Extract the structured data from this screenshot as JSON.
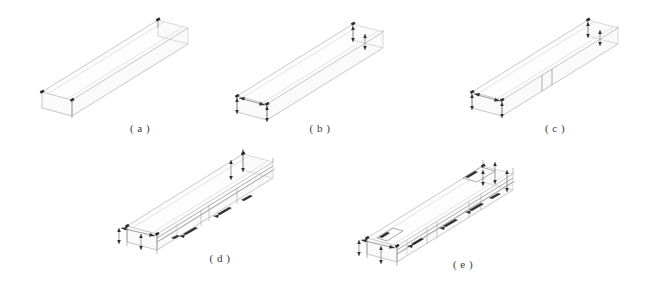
{
  "figure": {
    "background_color": "#ffffff",
    "line_color_light": "#d0d0d0",
    "line_color_dark": "#8a8a8a",
    "annotation_color": "#2e2e2e",
    "width_px": 645,
    "height_px": 290
  },
  "panels": [
    {
      "id": "a",
      "caption": "( a )",
      "description": "Plain elongated box volume, no annotations",
      "annotation_markers": 3,
      "dimension_arrows": 0,
      "internal_dividers": 0
    },
    {
      "id": "b",
      "caption": "( b )",
      "description": "Box volume with end-face dimension arrows",
      "annotation_markers": 6,
      "dimension_arrows": 4,
      "internal_dividers": 0
    },
    {
      "id": "c",
      "caption": "( c )",
      "description": "Box volume with dimension arrows and a transverse divider",
      "annotation_markers": 6,
      "dimension_arrows": 4,
      "internal_dividers": 1
    },
    {
      "id": "d",
      "caption": "( d )",
      "description": "Box volume with internal longitudinal members and hatched detail blocks",
      "annotation_markers": 9,
      "dimension_arrows": 5,
      "internal_dividers": 3
    },
    {
      "id": "e",
      "caption": "( e )",
      "description": "Fully detailed box volume with internal members, hatched blocks and end detailing",
      "annotation_markers": 12,
      "dimension_arrows": 6,
      "internal_dividers": 4
    }
  ]
}
